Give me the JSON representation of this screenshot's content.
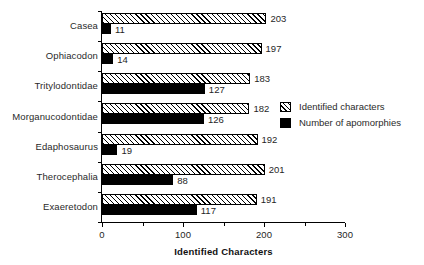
{
  "chart_data": {
    "type": "bar",
    "orientation": "horizontal",
    "title": "",
    "xlabel": "Identified Characters",
    "ylabel": "",
    "xlim": [
      0,
      300
    ],
    "xticks": [
      0,
      100,
      200,
      300
    ],
    "xtick_labels": [
      "0",
      "100",
      "200",
      "300"
    ],
    "minor_xticks": [
      50,
      150,
      250
    ],
    "grid": false,
    "legend_position": "right-middle",
    "categories": [
      "Casea",
      "Ophiacodon",
      "Tritylodontidae",
      "Morganucodontidae",
      "Edaphosaurus",
      "Therocephalia",
      "Exaeretodon"
    ],
    "series": [
      {
        "name": "Identified characters",
        "fill": "hatched",
        "values": [
          203,
          197,
          183,
          182,
          192,
          201,
          191
        ]
      },
      {
        "name": "Number of apomorphies",
        "fill": "solid",
        "values": [
          11,
          14,
          127,
          126,
          19,
          88,
          117
        ]
      }
    ]
  },
  "legend": {
    "items": [
      {
        "label": "Identified characters",
        "fill": "hatched"
      },
      {
        "label": "Number of apomorphies",
        "fill": "solid"
      }
    ]
  }
}
